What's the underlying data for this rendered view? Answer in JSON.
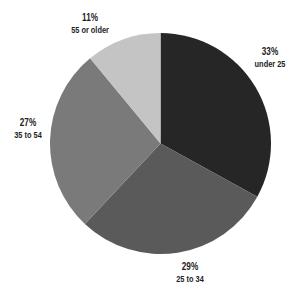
{
  "chart_data": {
    "type": "pie",
    "title": "",
    "categories": [
      "under 25",
      "25 to 34",
      "35 to 54",
      "55 or older"
    ],
    "values": [
      33,
      29,
      27,
      11
    ],
    "labels": [
      "33%",
      "29%",
      "27%",
      "11%"
    ],
    "colors": [
      "#262626",
      "#5a5a5a",
      "#7a7a7a",
      "#c4c4c4"
    ],
    "start_angle": "12 o'clock",
    "direction": "clockwise",
    "legend": "none (direct labels)"
  },
  "slices": [
    {
      "pct": "33%",
      "cat": "under 25"
    },
    {
      "pct": "29%",
      "cat": "25 to 34"
    },
    {
      "pct": "27%",
      "cat": "35 to 54"
    },
    {
      "pct": "11%",
      "cat": "55 or older"
    }
  ]
}
